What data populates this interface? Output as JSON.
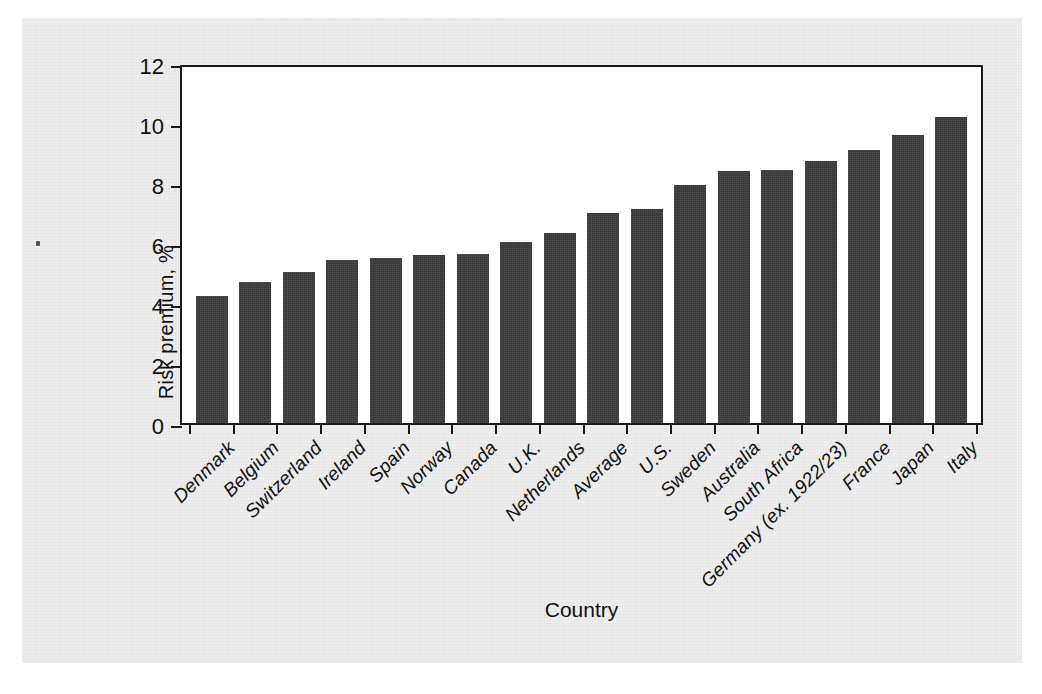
{
  "figure": {
    "background_color": "#eeeeee",
    "plot_background_color": "#ffffff",
    "bar_color": "#3a3a3a",
    "axis_color": "#1a1a1a"
  },
  "chart_data": {
    "type": "bar",
    "title": "",
    "xlabel": "Country",
    "ylabel": "Risk premium, %",
    "ylim": [
      0,
      12
    ],
    "yticks": [
      0,
      2,
      4,
      6,
      8,
      10,
      12
    ],
    "ytick_labels": [
      "0",
      "2",
      "4",
      "6",
      "8",
      "10",
      "12"
    ],
    "grid": false,
    "legend": false,
    "orientation": "vertical",
    "sorted": "ascending",
    "categories": [
      "Denmark",
      "Belgium",
      "Switzerland",
      "Ireland",
      "Spain",
      "Norway",
      "Canada",
      "U.K.",
      "Netherlands",
      "Average",
      "U.S.",
      "Sweden",
      "Australia",
      "South Africa",
      "Germany (ex. 1922/23)",
      "France",
      "Japan",
      "Italy"
    ],
    "values": [
      4.25,
      4.7,
      5.05,
      5.45,
      5.5,
      5.6,
      5.65,
      6.05,
      6.35,
      7.0,
      7.15,
      7.95,
      8.4,
      8.45,
      8.75,
      9.1,
      9.6,
      10.2
    ]
  }
}
